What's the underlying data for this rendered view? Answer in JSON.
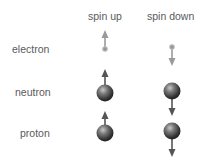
{
  "columns": {
    "spin_up": "spin up",
    "spin_down": "spin down"
  },
  "rows": {
    "electron": "electron",
    "neutron": "neutron",
    "proton": "proton"
  },
  "icons": {
    "electron_up": "electron-spin-up-icon",
    "electron_down": "electron-spin-down-icon",
    "neutron_up": "neutron-spin-up-icon",
    "neutron_down": "neutron-spin-down-icon",
    "proton_up": "proton-spin-up-icon",
    "proton_down": "proton-spin-down-icon"
  },
  "colors": {
    "label_text": "#5a5a5a",
    "electron_arrow": "#9a9a9a",
    "particle_arrow": "#555555"
  }
}
